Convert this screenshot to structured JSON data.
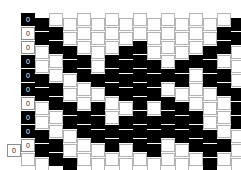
{
  "diagram": {
    "colors": {
      "dark": "#000000",
      "light": "#ffffff",
      "grid_line": "#b4b4b4",
      "background": "#ffffff"
    },
    "cell": {
      "width": 14,
      "height": 13,
      "col_step": 14,
      "row_step": 14,
      "offset": 5
    },
    "origin": {
      "x": 21,
      "y": 13
    },
    "label_text": "0",
    "labeled_column_index": 0,
    "extra_label_cell": {
      "col": -1,
      "row": 9,
      "state": "light",
      "label": "0"
    },
    "column_count": 16,
    "row_count": 11,
    "column_labels": [
      "0",
      "0",
      "0",
      "0",
      "0",
      "0",
      "0",
      "0",
      "0",
      "0",
      "0"
    ],
    "grid": [
      [
        "d",
        "d",
        "l",
        "l",
        "l",
        "l",
        "l",
        "l",
        "l",
        "l",
        "l",
        "l",
        "l",
        "l",
        "l",
        "d"
      ],
      [
        "l",
        "d",
        "d",
        "l",
        "l",
        "l",
        "l",
        "l",
        "l",
        "l",
        "l",
        "l",
        "l",
        "l",
        "d",
        "d"
      ],
      [
        "l",
        "l",
        "d",
        "d",
        "l",
        "l",
        "l",
        "d",
        "d",
        "l",
        "l",
        "l",
        "l",
        "d",
        "d",
        "l"
      ],
      [
        "d",
        "l",
        "l",
        "d",
        "d",
        "l",
        "d",
        "d",
        "d",
        "d",
        "l",
        "d",
        "d",
        "d",
        "l",
        "l"
      ],
      [
        "d",
        "d",
        "l",
        "l",
        "d",
        "d",
        "d",
        "d",
        "d",
        "d",
        "d",
        "d",
        "l",
        "d",
        "d",
        "l"
      ],
      [
        "d",
        "d",
        "d",
        "l",
        "l",
        "l",
        "d",
        "d",
        "d",
        "d",
        "l",
        "l",
        "l",
        "l",
        "d",
        "d"
      ],
      [
        "l",
        "l",
        "d",
        "d",
        "l",
        "d",
        "l",
        "l",
        "d",
        "l",
        "d",
        "d",
        "l",
        "l",
        "l",
        "d"
      ],
      [
        "d",
        "l",
        "l",
        "d",
        "d",
        "d",
        "l",
        "d",
        "d",
        "d",
        "d",
        "d",
        "d",
        "l",
        "l",
        "d"
      ],
      [
        "d",
        "d",
        "l",
        "l",
        "d",
        "d",
        "d",
        "d",
        "d",
        "d",
        "d",
        "d",
        "d",
        "d",
        "l",
        "l"
      ],
      [
        "l",
        "d",
        "d",
        "l",
        "l",
        "l",
        "d",
        "l",
        "d",
        "d",
        "l",
        "l",
        "d",
        "d",
        "d",
        "l"
      ],
      [
        "l",
        "l",
        "d",
        "d",
        "l",
        "l",
        "l",
        "l",
        "l",
        "l",
        "l",
        "l",
        "l",
        "d",
        "l",
        "l"
      ]
    ]
  }
}
